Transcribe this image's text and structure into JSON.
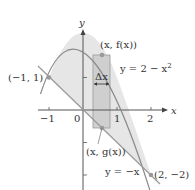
{
  "diagram": {
    "axes": {
      "x_label": "x",
      "y_label": "y",
      "x_ticks": [
        "−1",
        "0",
        "1",
        "2"
      ]
    },
    "curves": {
      "parabola_label": "y = 2 − x",
      "parabola_exponent": "2",
      "line_label": "y = −x"
    },
    "points": {
      "left_intersection": "(−1, 1)",
      "right_intersection": "(2, −2)",
      "top_point": "(x, f(x))",
      "bottom_point": "(x, g(x))"
    },
    "rectangle": {
      "width_label": "Δx"
    },
    "colors": {
      "region_fill": "#e4e4e4",
      "rect_fill": "#c9c9c9",
      "curve_stroke": "#8a8a8a",
      "axis": "#555555",
      "point": "#9a9a9a"
    }
  }
}
